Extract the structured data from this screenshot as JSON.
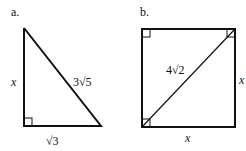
{
  "figure_a": {
    "label": "a.",
    "shape": "right triangle",
    "sides": {
      "vertical_leg": "x",
      "hypotenuse": "3√5",
      "horizontal_leg": "√3"
    },
    "right_angle": "bottom-left"
  },
  "figure_b": {
    "label": "b.",
    "shape": "square with diagonal",
    "sides": {
      "diagonal": "4√2",
      "right_side": "x",
      "bottom_side": "x"
    },
    "right_angle_marks": [
      "top-left",
      "top-right",
      "bottom-left"
    ]
  },
  "colors": {
    "stroke": "#111111",
    "background": "#ffffff"
  }
}
